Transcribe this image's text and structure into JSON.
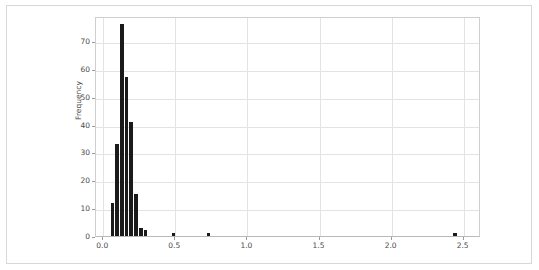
{
  "figure": {
    "background_color": "#ffffff",
    "frame_color": "#d8d8d8",
    "bar_color": "#1a1a1a",
    "grid_color": "#e3e3e3",
    "axis_color": "#cfcfcf"
  },
  "chart_data": {
    "type": "bar",
    "title": "",
    "xlabel": "",
    "ylabel": "Frequency",
    "xlim": [
      -0.05,
      2.62
    ],
    "ylim": [
      0,
      79
    ],
    "grid": true,
    "legend": null,
    "xticks": [
      "0.0",
      "0.5",
      "1.0",
      "1.5",
      "2.0",
      "2.5"
    ],
    "xtick_values": [
      0.0,
      0.5,
      1.0,
      1.5,
      2.0,
      2.5
    ],
    "yticks": [
      "0",
      "10",
      "20",
      "30",
      "40",
      "50",
      "60",
      "70"
    ],
    "ytick_values": [
      0,
      10,
      20,
      30,
      40,
      50,
      60,
      70
    ],
    "bin_width": 0.0325,
    "bins": [
      {
        "x": 0.065,
        "value": 12
      },
      {
        "x": 0.0975,
        "value": 33
      },
      {
        "x": 0.13,
        "value": 76
      },
      {
        "x": 0.1625,
        "value": 57
      },
      {
        "x": 0.195,
        "value": 41
      },
      {
        "x": 0.2275,
        "value": 15
      },
      {
        "x": 0.26,
        "value": 3
      },
      {
        "x": 0.2925,
        "value": 2
      },
      {
        "x": 0.4875,
        "value": 1
      },
      {
        "x": 0.7313,
        "value": 1
      },
      {
        "x": 2.4375,
        "value": 1
      }
    ]
  }
}
